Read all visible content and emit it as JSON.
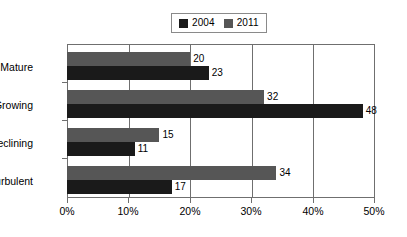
{
  "chart_data": {
    "type": "bar",
    "orientation": "horizontal",
    "title": "",
    "subtitle": "",
    "xlabel": "",
    "ylabel": "",
    "categories": [
      "Mature",
      "Growing",
      "Declining",
      "Turbulent"
    ],
    "series": [
      {
        "name": "2004",
        "color": "#1a1a1a",
        "values": [
          23,
          48,
          11,
          17
        ],
        "value_labels": [
          "23",
          "48",
          "11",
          "17"
        ]
      },
      {
        "name": "2011",
        "color": "#565656",
        "values": [
          20,
          32,
          15,
          34
        ],
        "value_labels": [
          "20",
          "32",
          "15",
          "34"
        ]
      }
    ],
    "xlim": [
      0,
      50
    ],
    "xtick_values": [
      0,
      10,
      20,
      30,
      40,
      50
    ],
    "xtick_labels": [
      "0%",
      "10%",
      "20%",
      "30%",
      "40%",
      "50%"
    ],
    "grid": true,
    "grid_axis": "x",
    "legend_position": "top-center",
    "value_labels_shown": true
  },
  "legend": {
    "entries": [
      {
        "label": "2004",
        "swatch": "legend-swatch-2004",
        "color": "#1a1a1a"
      },
      {
        "label": "2011",
        "swatch": "legend-swatch-2011",
        "color": "#565656"
      }
    ]
  },
  "colors": {
    "series_2004": "#1a1a1a",
    "series_2011": "#565656",
    "axis": "#6f6f6f",
    "legend_border": "#8a8a8a",
    "background": "#ffffff",
    "text": "#000000"
  }
}
